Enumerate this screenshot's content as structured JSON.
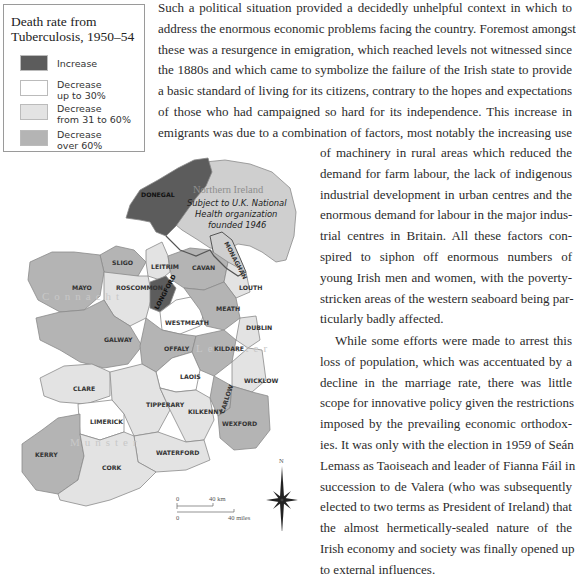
{
  "legend": {
    "title_line1": "Death rate from",
    "title_line2": "Tuberculosis, 1950–54",
    "items": [
      {
        "line1": "Increase",
        "line2": "",
        "color": "#5c5c5c"
      },
      {
        "line1": "Decrease",
        "line2": "up to 30%",
        "color": "#ffffff"
      },
      {
        "line1": "Decrease",
        "line2": "from 31 to 60%",
        "color": "#e3e3e3"
      },
      {
        "line1": "Decrease",
        "line2": "over 60%",
        "color": "#b4b4b4"
      }
    ]
  },
  "map": {
    "northern_ireland": {
      "title": "Northern Ireland",
      "note_line1": "Subject to U.K. National",
      "note_line2": "Health organization",
      "note_line3": "founded 1946"
    },
    "provinces": {
      "connacht": "Connacht",
      "leinster": "Leinster",
      "munster": "Munster"
    },
    "counties": {
      "donegal": "DONEGAL",
      "monaghan": "MONAGHAN",
      "sligo": "SLIGO",
      "leitrim": "LEITRIM",
      "cavan": "CAVAN",
      "mayo": "MAYO",
      "roscommon": "ROSCOMMON",
      "longford": "LONGFORD",
      "louth": "LOUTH",
      "meath": "MEATH",
      "westmeath": "WESTMEATH",
      "dublin": "DUBLIN",
      "galway": "GALWAY",
      "offaly": "OFFALY",
      "kildare": "KILDARE",
      "laois": "LAOIS",
      "wicklow": "WICKLOW",
      "clare": "CLARE",
      "carlow": "CARLOW",
      "tipperary": "TIPPERARY",
      "limerick": "LIMERICK",
      "kilkenny": "KILKENNY",
      "wexford": "WEXFORD",
      "kerry": "KERRY",
      "cork": "CORK",
      "waterford": "WATERFORD"
    },
    "scale": {
      "km_zero": "0",
      "km_label": "40 km",
      "mi_zero": "0",
      "mi_label": "40 miles"
    },
    "compass": {
      "north": "N"
    }
  },
  "text": {
    "para1_full": [
      "Such a political situation provided a decidedly unhelpful context in which to",
      "address the enormous economic problems facing the country. Foremost amongst",
      "these was a resurgence in emigration, which reached levels not witnessed since",
      "the 1880s and which came to symbolize the failure of the Irish state to provide",
      "a basic standard of living for its citizens, contrary to the hopes and expectations",
      "of those who had campaigned so hard for its independence. This increase in",
      "emigrants was due to a combination of factors, most notably the increasing use"
    ],
    "para1_col": [
      "of machinery in rural areas which reduced the",
      "demand for farm labour, the lack of indigenous",
      "industrial development in urban centres and the",
      "enormous demand for labour in the major indus-",
      "trial centres in Britain. All these factors con-",
      "spired to siphon off enormous numbers of",
      "young Irish men and women, with the poverty-",
      "stricken areas of the western seaboard being par-",
      "ticularly badly affected."
    ],
    "para2": [
      "While some efforts were made to arrest this",
      "loss of population, which was accentuated by a",
      "decline in the marriage rate, there was little",
      "scope for innovative policy given the restrictions",
      "imposed by the prevailing economic orthodox-",
      "ies. It was only with the election in 1959 of Seán",
      "Lemass as Taoiseach and leader of Fianna Fáil in",
      "succession to de Valera (who was subsequently",
      "elected to two terms as President of Ireland) that",
      "the almost hermetically-sealed nature of the",
      "Irish economy and society was finally opened up",
      "to external influences."
    ]
  }
}
